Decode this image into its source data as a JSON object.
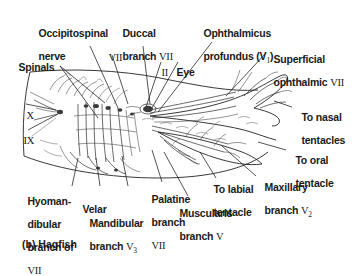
{
  "figure": {
    "caption": "(b) Hagfish",
    "line_color": "#2b2b2b",
    "background_color": "#ffffff",
    "text_color": "#1a1a1a"
  },
  "labels": {
    "occipitospinal_nerve": {
      "line1": "Occipitospinal",
      "line2": "nerve"
    },
    "spinals": {
      "line1": "Spinals"
    },
    "nerve_vii_top": {
      "line1": "VII"
    },
    "duccal_branch": {
      "line1": "Duccal",
      "line2": "branch ",
      "roman": "VII"
    },
    "nerve_ii": {
      "line1": "II"
    },
    "eye": {
      "line1": "Eye"
    },
    "ophthalmicus_profundus": {
      "line1": "Ophthalmicus",
      "line2": "profundus (V",
      "sub": "1",
      "line2_end": ")"
    },
    "superficial_ophthalmic": {
      "line1": "Superficial",
      "line2": "ophthalmic ",
      "roman": "VII"
    },
    "to_nasal_tentacles": {
      "line1": "To nasal",
      "line2": "tentacles"
    },
    "to_oral_tentacle": {
      "line1": "To oral",
      "line2": "tentacle"
    },
    "maxillary_branch": {
      "line1": "Maxillary",
      "line2": "branch ",
      "roman": "V",
      "sub": "2"
    },
    "to_labial_tentacle": {
      "line1": "To labial",
      "line2": "tentacle"
    },
    "muscularis_branch": {
      "line1": "Muscularis",
      "line2": "branch ",
      "roman": "V"
    },
    "palatine_branch": {
      "line1": "Palatine",
      "line2": "branch",
      "roman": "VII"
    },
    "mandibular_branch": {
      "line1": "Mandibular",
      "line2": "branch ",
      "roman": "V",
      "sub": "3"
    },
    "velar": {
      "line1": "Velar"
    },
    "hyomandibular_branch": {
      "line1": "Hyoman-",
      "line2": "dibular",
      "line3": "branch of",
      "roman": "VII"
    },
    "nerve_x": {
      "line1": "X"
    },
    "nerve_ix": {
      "line1": "IX"
    }
  }
}
